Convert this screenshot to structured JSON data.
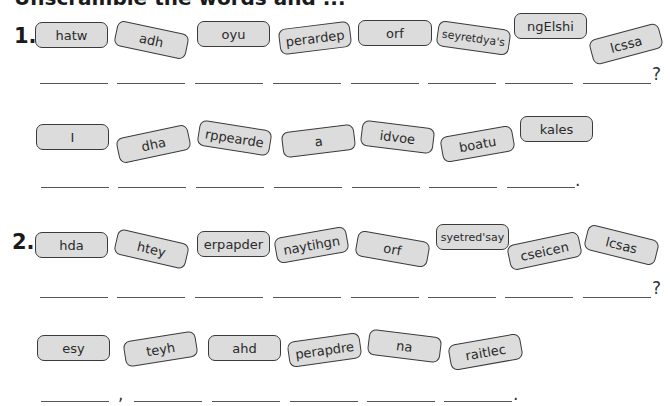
{
  "title": "Unscramble the words and ...",
  "exercises": [
    {
      "number": "1.",
      "sentences": [
        {
          "tiles": [
            "hatw",
            "adh",
            "oyu",
            "perardep",
            "orf",
            "seyretdya's",
            "ngElshi",
            "lcssa"
          ],
          "end_punctuation": "?",
          "blank_count": 8
        },
        {
          "tiles": [
            "I",
            "dha",
            "rppearde",
            "a",
            "idvoe",
            "boatu",
            "kales"
          ],
          "end_punctuation": ".",
          "blank_count": 7
        }
      ]
    },
    {
      "number": "2.",
      "sentences": [
        {
          "tiles": [
            "hda",
            "htey",
            "erpapder",
            "naytihgn",
            "orf",
            "syetred'say",
            "cseicen",
            "lcsas"
          ],
          "end_punctuation": "?",
          "blank_count": 8
        },
        {
          "tiles": [
            "esy",
            "teyh",
            "ahd",
            "perapdre",
            "na",
            "raitlec"
          ],
          "mid_punctuation": ",",
          "end_punctuation": ".",
          "blank_count": 6
        }
      ]
    }
  ]
}
